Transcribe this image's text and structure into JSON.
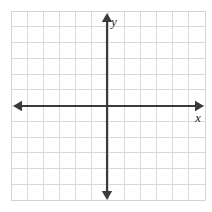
{
  "figure": {
    "kind": "cartesian-coordinate-grid",
    "background_color": "#ffffff",
    "width": 212,
    "height": 212
  },
  "grid": {
    "line_color": "#d9d9d9",
    "border_color": "#d4d4d4",
    "columns": 12,
    "rows": 12,
    "left": 11,
    "top": 11,
    "right": 205,
    "bottom": 200,
    "cell_width": 16.17,
    "cell_height": 15.75
  },
  "axes": {
    "color": "#3b3b3b",
    "stroke_width": 2.1,
    "origin_x": 107,
    "origin_y": 106,
    "x_axis": {
      "label": "x",
      "label_x": 198,
      "label_y": 122,
      "start_x": 13,
      "end_x": 204,
      "arrow_left": true,
      "arrow_right": true
    },
    "y_axis": {
      "label": "y",
      "label_x": 114,
      "label_y": 26,
      "start_y": 13,
      "end_y": 200,
      "arrow_up": true,
      "arrow_down": true
    }
  },
  "chart_data": {
    "type": "scatter",
    "title": "",
    "subtitle": "",
    "xlabel": "x",
    "ylabel": "y",
    "xlim": [
      -6,
      6
    ],
    "ylim": [
      -6,
      6
    ],
    "xticks": [
      -6,
      -5,
      -4,
      -3,
      -2,
      -1,
      0,
      1,
      2,
      3,
      4,
      5,
      6
    ],
    "yticks": [
      -6,
      -5,
      -4,
      -3,
      -2,
      -1,
      0,
      1,
      2,
      3,
      4,
      5,
      6
    ],
    "xtick_labels": [],
    "ytick_labels": [],
    "grid": true,
    "legend": null,
    "series": [],
    "annotations": []
  }
}
